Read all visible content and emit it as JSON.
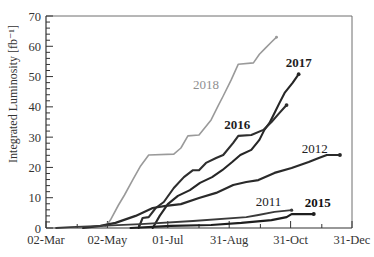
{
  "chart_data": {
    "type": "line",
    "title": "",
    "xlabel": "",
    "ylabel": "Integrated Luminosity [fb⁻¹]",
    "x_unit": "days since 02-Mar",
    "xlim": [
      0,
      304
    ],
    "ylim": [
      0,
      70
    ],
    "grid": false,
    "legend": "inline labels",
    "x_ticks": [
      {
        "day": 0,
        "label": "02-Mar"
      },
      {
        "day": 61,
        "label": "02-May"
      },
      {
        "day": 121,
        "label": "01-Jul"
      },
      {
        "day": 182,
        "label": "31-Aug"
      },
      {
        "day": 243,
        "label": "31-Oct"
      },
      {
        "day": 304,
        "label": "31-Dec"
      }
    ],
    "x_minor_ticks": [
      31,
      92,
      152,
      213,
      274
    ],
    "y_ticks": [
      0,
      10,
      20,
      30,
      40,
      50,
      60,
      70
    ],
    "y_minor_step": 2,
    "series": [
      {
        "name": "2018",
        "color": "#9a9a9a",
        "label_color": "#8f8f8f",
        "bold": false,
        "width": 1.6,
        "label_pos": {
          "day": 159,
          "value": 47.5
        },
        "points": [
          [
            58,
            0
          ],
          [
            64,
            2.6
          ],
          [
            72,
            7.6
          ],
          [
            78,
            10.9
          ],
          [
            86,
            15.8
          ],
          [
            94,
            20.5
          ],
          [
            102,
            24.1
          ],
          [
            127,
            24.4
          ],
          [
            134,
            26.4
          ],
          [
            141,
            30.4
          ],
          [
            152,
            30.7
          ],
          [
            164,
            35.7
          ],
          [
            171,
            40.3
          ],
          [
            176,
            43.6
          ],
          [
            184,
            48.9
          ],
          [
            191,
            54.1
          ],
          [
            206,
            54.5
          ],
          [
            212,
            57.4
          ],
          [
            218,
            59.4
          ],
          [
            224,
            61.4
          ],
          [
            229,
            63.0
          ]
        ]
      },
      {
        "name": "2017",
        "color": "#262626",
        "label_color": "#1e1e1e",
        "bold": true,
        "width": 2.1,
        "label_pos": {
          "day": 251,
          "value": 54.8
        },
        "points": [
          [
            106,
            0
          ],
          [
            113,
            4.0
          ],
          [
            121,
            7.9
          ],
          [
            131,
            10.6
          ],
          [
            143,
            12.5
          ],
          [
            153,
            14.9
          ],
          [
            165,
            16.8
          ],
          [
            175,
            19.1
          ],
          [
            185,
            21.8
          ],
          [
            193,
            24.1
          ],
          [
            204,
            25.8
          ],
          [
            212,
            29.1
          ],
          [
            217,
            32.4
          ],
          [
            222,
            34.7
          ],
          [
            228,
            38.6
          ],
          [
            232,
            41.3
          ],
          [
            237,
            44.6
          ],
          [
            245,
            47.9
          ],
          [
            251,
            50.8
          ]
        ]
      },
      {
        "name": "2016",
        "color": "#2e2e2e",
        "label_color": "#1e1e1e",
        "bold": true,
        "width": 2.1,
        "label_pos": {
          "day": 190,
          "value": 34.3
        },
        "points": [
          [
            92,
            0
          ],
          [
            96,
            3.3
          ],
          [
            102,
            3.6
          ],
          [
            109,
            6.6
          ],
          [
            117,
            8.6
          ],
          [
            127,
            13.2
          ],
          [
            137,
            16.8
          ],
          [
            146,
            19.1
          ],
          [
            152,
            19.1
          ],
          [
            159,
            21.5
          ],
          [
            169,
            23.1
          ],
          [
            176,
            24.1
          ],
          [
            186,
            28.1
          ],
          [
            191,
            30.4
          ],
          [
            204,
            30.7
          ],
          [
            216,
            32.4
          ],
          [
            224,
            35.0
          ],
          [
            232,
            38.0
          ],
          [
            239,
            40.6
          ]
        ]
      },
      {
        "name": "2012",
        "color": "#2a2a2a",
        "label_color": "#222222",
        "bold": false,
        "width": 2.2,
        "label_pos": {
          "day": 267,
          "value": 26.1
        },
        "points": [
          [
            37,
            0
          ],
          [
            54,
            0.7
          ],
          [
            69,
            1.7
          ],
          [
            89,
            4.0
          ],
          [
            106,
            6.6
          ],
          [
            119,
            7.3
          ],
          [
            134,
            7.9
          ],
          [
            152,
            9.9
          ],
          [
            169,
            11.6
          ],
          [
            186,
            14.2
          ],
          [
            199,
            15.2
          ],
          [
            211,
            15.8
          ],
          [
            227,
            18.2
          ],
          [
            244,
            19.8
          ],
          [
            261,
            21.8
          ],
          [
            271,
            23.1
          ],
          [
            279,
            24.1
          ],
          [
            292,
            24.1
          ]
        ]
      },
      {
        "name": "2011",
        "color": "#3a3a3a",
        "label_color": "#222222",
        "bold": false,
        "width": 1.8,
        "label_pos": {
          "day": 221,
          "value": 8.6
        },
        "points": [
          [
            10,
            0
          ],
          [
            24,
            0.3
          ],
          [
            54,
            0.7
          ],
          [
            94,
            1.3
          ],
          [
            146,
            2.3
          ],
          [
            199,
            3.6
          ],
          [
            211,
            4.3
          ],
          [
            227,
            5.3
          ],
          [
            244,
            5.9
          ]
        ]
      },
      {
        "name": "2015",
        "color": "#1e1e1e",
        "label_color": "#111111",
        "bold": true,
        "width": 2.2,
        "label_pos": {
          "day": 270,
          "value": 8.3
        },
        "points": [
          [
            84,
            0
          ],
          [
            124,
            0.7
          ],
          [
            164,
            1.0
          ],
          [
            194,
            1.7
          ],
          [
            224,
            2.6
          ],
          [
            239,
            3.6
          ],
          [
            244,
            4.6
          ],
          [
            266,
            4.6
          ]
        ]
      }
    ]
  }
}
